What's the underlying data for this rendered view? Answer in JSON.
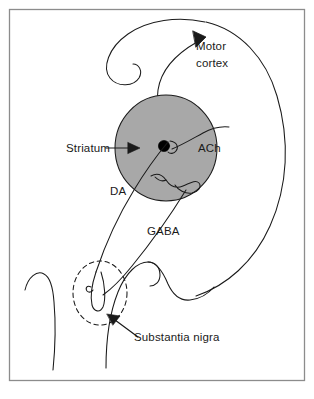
{
  "figure": {
    "background_color": "#ffffff",
    "border_color": "#8c8c8c",
    "line_color": "#1a1a1a",
    "structure_fill_color": "#a8a8a8",
    "soma_color": "#000000"
  },
  "labels": {
    "motor_cortex_line1": "Motor",
    "motor_cortex_line2": "cortex",
    "striatum": "Striatum",
    "ach": "ACh",
    "da": "DA",
    "gaba": "GABA",
    "substantia_nigra": "Substantia nigra"
  },
  "structures": [
    {
      "name": "striatum",
      "shape": "ellipse",
      "fill": "#a8a8a8",
      "stroke": "#1a1a1a"
    },
    {
      "name": "substantia-nigra",
      "shape": "dashed-circle",
      "fill": "none",
      "stroke": "#1a1a1a"
    },
    {
      "name": "cholinergic-interneuron-soma",
      "shape": "filled-circle",
      "fill": "#000000"
    }
  ],
  "pathways": [
    {
      "name": "dopamine-pathway",
      "label": "DA",
      "from": "substantia-nigra",
      "to": "striatum"
    },
    {
      "name": "gaba-pathway",
      "label": "GABA",
      "from": "striatum",
      "to": "substantia-nigra"
    },
    {
      "name": "corticostriatal-pathway",
      "label": "Motor cortex",
      "from": "striatum",
      "to": "motor-cortex",
      "arrow": true
    },
    {
      "name": "acetylcholine-interneuron",
      "label": "ACh",
      "from": "striatum",
      "to": "striatum"
    }
  ],
  "annotations": [
    {
      "name": "striatum-pointer",
      "label": "Striatum",
      "arrow_direction": "right"
    },
    {
      "name": "substantia-nigra-pointer",
      "label": "Substantia nigra",
      "arrow_direction": "upper-left"
    },
    {
      "name": "motor-cortex-arrowhead",
      "label": "Motor cortex",
      "arrow_direction": "up-right"
    }
  ]
}
